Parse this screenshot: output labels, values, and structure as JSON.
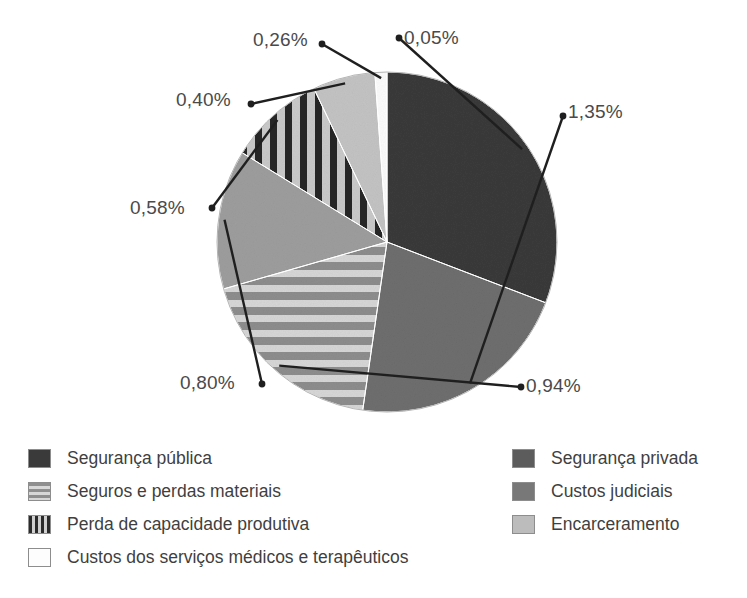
{
  "chart_data": {
    "type": "pie",
    "title": "",
    "unit": "%",
    "decimal_separator": ",",
    "total": 4.38,
    "start_angle_deg": 0,
    "direction": "clockwise",
    "categories": [
      "Segurança pública",
      "Segurança privada",
      "Seguros e perdas materiais",
      "Custos judiciais",
      "Perda de capacidade produtiva",
      "Encarceramento",
      "Custos dos serviços médicos e terapêuticos"
    ],
    "values": [
      1.35,
      0.94,
      0.8,
      0.58,
      0.4,
      0.26,
      0.05
    ],
    "labels": [
      "1,35%",
      "0,94%",
      "0,80%",
      "0,58%",
      "0,40%",
      "0,26%",
      "0,05%"
    ],
    "slices": [
      {
        "name": "Segurança pública",
        "label": "1,35%",
        "value": 1.35,
        "angle_deg": 110.96,
        "fill": "#3a3a3a",
        "pattern": "solid"
      },
      {
        "name": "Segurança privada",
        "label": "0,94%",
        "value": 0.94,
        "angle_deg": 77.26,
        "fill": "#6e6e6e",
        "pattern": "solid"
      },
      {
        "name": "Seguros e perdas materiais",
        "label": "0,80%",
        "value": 0.8,
        "angle_deg": 65.75,
        "fill": "#9a9a9a",
        "pattern": "horizontal-stripes"
      },
      {
        "name": "Custos judiciais",
        "label": "0,58%",
        "value": 0.58,
        "angle_deg": 47.67,
        "fill": "#9d9d9d",
        "pattern": "solid"
      },
      {
        "name": "Perda de capacidade produtiva",
        "label": "0,40%",
        "value": 0.4,
        "angle_deg": 32.88,
        "fill": "#aaaaaa",
        "pattern": "vertical-stripes"
      },
      {
        "name": "Encarceramento",
        "label": "0,26%",
        "value": 0.26,
        "angle_deg": 21.37,
        "fill": "#c3c3c3",
        "pattern": "solid"
      },
      {
        "name": "Custos dos serviços médicos e terapêuticos",
        "label": "0,05%",
        "value": 0.05,
        "angle_deg": 4.11,
        "fill": "#fbfbfb",
        "pattern": "solid"
      }
    ],
    "legend": {
      "position": "bottom",
      "columns": [
        {
          "items": [
            {
              "label": "Segurança pública",
              "swatch": "dark",
              "color": "#3a3a3a"
            },
            {
              "label": "Seguros e perdas materiais",
              "swatch": "horizontal-stripes",
              "color": "#9a9a9a"
            },
            {
              "label": "Perda de capacidade produtiva",
              "swatch": "vertical-stripes",
              "color": "#2b2b2b"
            },
            {
              "label": "Custos dos serviços médicos e terapêuticos",
              "swatch": "white",
              "color": "#fdfdfd"
            }
          ]
        },
        {
          "items": [
            {
              "label": "Segurança privada",
              "swatch": "medium-dark",
              "color": "#5c5c5c"
            },
            {
              "label": "Custos judiciais",
              "swatch": "medium",
              "color": "#787878"
            },
            {
              "label": "Encarceramento",
              "swatch": "light",
              "color": "#bcbcbc"
            }
          ]
        }
      ]
    },
    "callouts": [
      {
        "label": "0,05%",
        "x": 404,
        "y": 27
      },
      {
        "label": "1,35%",
        "x": 568,
        "y": 101
      },
      {
        "label": "0,94%",
        "x": 526,
        "y": 375
      },
      {
        "label": "0,80%",
        "x": 180,
        "y": 372
      },
      {
        "label": "0,58%",
        "x": 130,
        "y": 197
      },
      {
        "label": "0,40%",
        "x": 176,
        "y": 89
      },
      {
        "label": "0,26%",
        "x": 253,
        "y": 29
      }
    ],
    "geometry": {
      "cx": 387,
      "cy": 242,
      "r": 170
    }
  }
}
